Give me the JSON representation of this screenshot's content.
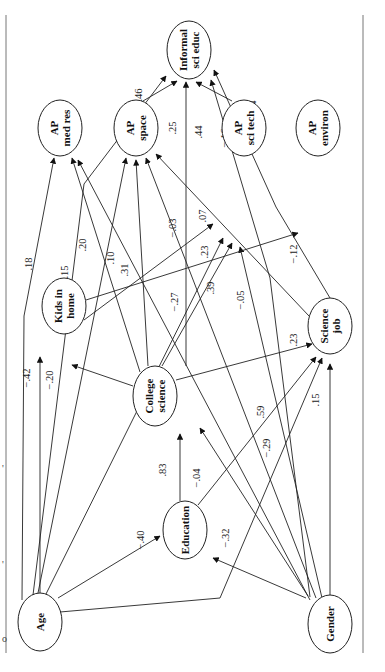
{
  "diagram": {
    "type": "path-diagram",
    "orientation": "rotated-90",
    "frame": {
      "left_x": 6,
      "right_x": 363,
      "top_y": 15,
      "bottom_y": 653
    },
    "left_edge_fragments": [
      {
        "x": 2,
        "y": 472,
        "text": "'"
      },
      {
        "x": 2,
        "y": 568,
        "text": "'"
      },
      {
        "x": 2,
        "y": 642,
        "text": "o"
      }
    ],
    "nodes": [
      {
        "id": "informal",
        "lines": [
          "Informal",
          "sci educ"
        ],
        "cx": 189,
        "cy": 50,
        "rx": 22,
        "ry": 29
      },
      {
        "id": "ap_med",
        "lines": [
          "AP",
          "med res"
        ],
        "cx": 60,
        "cy": 128,
        "rx": 22,
        "ry": 28
      },
      {
        "id": "ap_space",
        "lines": [
          "AP",
          "space"
        ],
        "cx": 136,
        "cy": 128,
        "rx": 22,
        "ry": 28
      },
      {
        "id": "ap_scitech",
        "lines": [
          "AP",
          "sci tech"
        ],
        "cx": 244,
        "cy": 128,
        "rx": 22,
        "ry": 28
      },
      {
        "id": "ap_environ",
        "lines": [
          "AP",
          "environ"
        ],
        "cx": 318,
        "cy": 128,
        "rx": 22,
        "ry": 28
      },
      {
        "id": "kids",
        "lines": [
          "Kids in",
          "home"
        ],
        "cx": 64,
        "cy": 306,
        "rx": 22,
        "ry": 28
      },
      {
        "id": "college",
        "lines": [
          "College",
          "science"
        ],
        "cx": 155,
        "cy": 396,
        "rx": 22,
        "ry": 30
      },
      {
        "id": "science_job",
        "lines": [
          "Science",
          "job"
        ],
        "cx": 330,
        "cy": 326,
        "rx": 22,
        "ry": 28
      },
      {
        "id": "education",
        "lines": [
          "Education"
        ],
        "cx": 185,
        "cy": 530,
        "rx": 22,
        "ry": 29
      },
      {
        "id": "age",
        "lines": [
          "Age"
        ],
        "cx": 40,
        "cy": 622,
        "rx": 22,
        "ry": 29
      },
      {
        "id": "gender",
        "lines": [
          "Gender"
        ],
        "cx": 330,
        "cy": 624,
        "rx": 22,
        "ry": 29
      }
    ],
    "edges": [
      {
        "from": "age",
        "to": "informal",
        "coef": "−.46",
        "path": "M33,595 L84,184 L166,76",
        "lx": 142,
        "ly": 98
      },
      {
        "from": "ap_space",
        "to": "informal",
        "coef": "−.14",
        "path": "M143,101 L177,81",
        "lx": 137,
        "ly": 118,
        "alt_lx": 150,
        "alt_ly": 122
      },
      {
        "from": "college",
        "to": "informal",
        "coef": ".25",
        "path": "M186,366 L186,82",
        "lx": 176,
        "ly": 128
      },
      {
        "from": "ap_scitech",
        "to": "informal",
        "coef": ".44",
        "path": "M232,101 L196,82",
        "lx": 202,
        "ly": 132
      },
      {
        "from": "gender",
        "to": "informal",
        "coef": "−.16",
        "path": "M310,597 L270,278 L211,80",
        "lx": 228,
        "ly": 138
      },
      {
        "from": "science_job",
        "to": "informal",
        "coef": "−.14",
        "path": "M330,298 L276,207 L214,70",
        "lx": 256,
        "ly": 110
      },
      {
        "from": "age",
        "to": "ap_med",
        "coef": ".18",
        "path": "M22,600 L24,316 L54,158",
        "lx": 32,
        "ly": 264
      },
      {
        "from": "college",
        "to": "ap_med",
        "coef": ".15",
        "path": "M140,372 L72,158",
        "lx": 68,
        "ly": 272
      },
      {
        "from": "gender",
        "to": "ap_med",
        "coef": ".20",
        "path": "M310,600 L78,160",
        "lx": 86,
        "ly": 245
      },
      {
        "from": "age",
        "to": "ap_space",
        "coef": ".10",
        "path": "M38,593 L126,158",
        "lx": 114,
        "ly": 258
      },
      {
        "from": "college",
        "to": "ap_space",
        "coef": ".31",
        "path": "M148,366 L136,160",
        "lx": 128,
        "ly": 270
      },
      {
        "from": "gender",
        "to": "ap_space",
        "coef": "−.27",
        "path": "M316,598 L146,158",
        "lx": 178,
        "ly": 302
      },
      {
        "from": "science_job",
        "to": "ap_space",
        "coef": "−.03",
        "path": "M309,316 L156,154",
        "lx": 176,
        "ly": 228
      },
      {
        "from": "kids",
        "to": "ap_scitech",
        "coef": ".07",
        "path": "M84,320 L213,224",
        "lx": 206,
        "ly": 216
      },
      {
        "from": "age",
        "to": "ap_scitech",
        "coef": ".23",
        "path": "M46,594 L223,238",
        "lx": 208,
        "ly": 252
      },
      {
        "from": "college",
        "to": "ap_scitech",
        "coef": ".39",
        "path": "M162,366 L232,243",
        "lx": 214,
        "ly": 288
      },
      {
        "from": "gender",
        "to": "ap_scitech",
        "coef": "−.05",
        "path": "M322,598 L240,247",
        "lx": 244,
        "ly": 300
      },
      {
        "from": "kids",
        "to": "ap_environ",
        "coef": "−.12",
        "path": "M86,300 L298,233",
        "lx": 297,
        "ly": 254
      },
      {
        "from": "age",
        "to": "kids",
        "coef": "−.42",
        "path": "M40,593 L40,357",
        "lx": 30,
        "ly": 378
      },
      {
        "from": "college",
        "to": "kids",
        "coef": "−.20",
        "path": "M133,386 L72,365",
        "lx": 53,
        "ly": 380
      },
      {
        "from": "college",
        "to": "science_job",
        "coef": ".23",
        "path": "M176,380 L312,344",
        "lx": 297,
        "ly": 340
      },
      {
        "from": "education",
        "to": "science_job",
        "coef": ".59",
        "path": "M198,505 L316,357",
        "lx": 264,
        "ly": 412
      },
      {
        "from": "age",
        "to": "science_job",
        "coef": "−.29",
        "path": "M60,612 L220,598 L322,358",
        "lx": 270,
        "ly": 448
      },
      {
        "from": "gender",
        "to": "science_job",
        "coef": ".15",
        "path": "M330,595 L330,364",
        "lx": 319,
        "ly": 400
      },
      {
        "from": "education",
        "to": "college",
        "coef": ".83",
        "path": "M180,501 L180,434",
        "lx": 166,
        "ly": 470
      },
      {
        "from": "gender",
        "to": "college",
        "coef": "−.04",
        "path": "M308,596 L200,428",
        "lx": 200,
        "ly": 478
      },
      {
        "from": "age",
        "to": "education",
        "coef": "−.40",
        "path": "M58,598 L160,536",
        "lx": 144,
        "ly": 540
      },
      {
        "from": "gender",
        "to": "education",
        "coef": "−.32",
        "path": "M306,598 L213,558",
        "lx": 229,
        "ly": 538
      }
    ],
    "edge_color": "#222222",
    "node_fill": "#ffffff",
    "frame_color": "#777777"
  }
}
